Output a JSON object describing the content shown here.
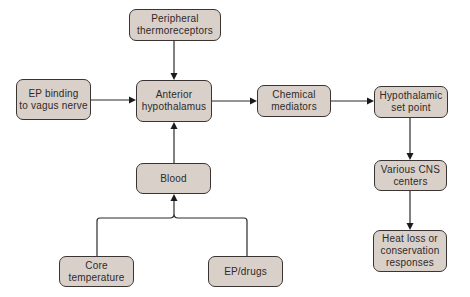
{
  "diagram": {
    "type": "flowchart",
    "nodes": {
      "peripheral": "Peripheral\nthermoreceptors",
      "ep_binding": "EP binding\nto vagus nerve",
      "anterior": "Anterior\nhypothalamus",
      "chemical": "Chemical\nmediators",
      "setpoint": "Hypothalamic\nset point",
      "blood": "Blood",
      "cns": "Various CNS\ncenters",
      "heatloss": "Heat loss or\nconservation\nresponses",
      "core": "Core\ntemperature",
      "epdrugs": "EP/drugs"
    },
    "edges": [
      {
        "from": "Peripheral thermoreceptors",
        "to": "Anterior hypothalamus"
      },
      {
        "from": "EP binding to vagus nerve",
        "to": "Anterior hypothalamus"
      },
      {
        "from": "Blood",
        "to": "Anterior hypothalamus"
      },
      {
        "from": "Anterior hypothalamus",
        "to": "Chemical mediators"
      },
      {
        "from": "Chemical mediators",
        "to": "Hypothalamic set point"
      },
      {
        "from": "Hypothalamic set point",
        "to": "Various CNS centers"
      },
      {
        "from": "Various CNS centers",
        "to": "Heat loss or conservation responses"
      },
      {
        "from": "Core temperature",
        "to": "Blood"
      },
      {
        "from": "EP/drugs",
        "to": "Blood"
      }
    ],
    "colors": {
      "node_fill": "#d9d0ca",
      "node_border": "#3a3432",
      "text": "#2e2a28",
      "arrow": "#2a2a2a"
    }
  }
}
